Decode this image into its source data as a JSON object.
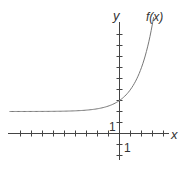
{
  "chart_data": {
    "type": "line",
    "title": "",
    "xlabel": "x",
    "ylabel": "y",
    "curve_label": "f(x)",
    "function": "f(x) = 2^x + 2",
    "asymptote_y": 2,
    "y_intercept": 3,
    "x_tick_unit_label": "1",
    "y_tick_unit_label": "1",
    "xlim": [
      -10,
      4.5
    ],
    "ylim": [
      -2.5,
      10.3
    ],
    "x_ticks": [
      -9,
      -8,
      -7,
      -6,
      -5,
      -4,
      -3,
      -2,
      -1,
      1,
      2,
      3,
      4
    ],
    "y_ticks": [
      -2,
      -1,
      1,
      2,
      3,
      4,
      5,
      6,
      7,
      8,
      9
    ],
    "grid": false,
    "legend": "none",
    "series": [
      {
        "name": "f(x)",
        "x": [
          -10,
          -8,
          -6,
          -4,
          -3,
          -2,
          -1,
          0,
          0.5,
          1,
          1.5,
          2,
          2.5,
          3,
          3.1
        ],
        "y": [
          2.001,
          2.004,
          2.016,
          2.06,
          2.13,
          2.25,
          2.5,
          3,
          3.41,
          4,
          4.83,
          6,
          7.66,
          10,
          10.57
        ]
      }
    ],
    "colors": {
      "axis": "#444444",
      "curve": "#777777",
      "text": "#333333"
    }
  }
}
